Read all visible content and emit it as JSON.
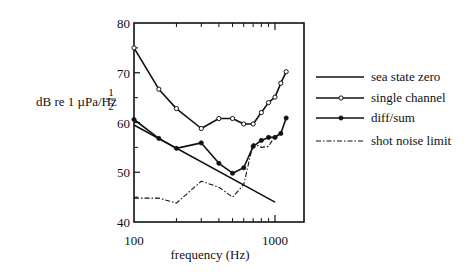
{
  "chart_data": {
    "type": "line",
    "title": "",
    "xlabel": "frequency (Hz)",
    "ylabel": "dB re 1 µPa/Hz",
    "ylabel_exponent_num": "1",
    "ylabel_exponent_den": "2",
    "xscale": "log",
    "xlim": [
      100,
      1600
    ],
    "ylim": [
      40,
      80
    ],
    "x_tick_labels": [
      {
        "value": 100,
        "label": "100"
      },
      {
        "value": 1000,
        "label": "1000"
      }
    ],
    "x_minor_ticks": [
      200,
      300,
      400,
      500,
      600,
      700,
      800,
      900
    ],
    "y_tick_labels": [
      {
        "value": 40,
        "label": "40"
      },
      {
        "value": 50,
        "label": "50"
      },
      {
        "value": 60,
        "label": "60"
      },
      {
        "value": 70,
        "label": "70"
      },
      {
        "value": 80,
        "label": "80"
      }
    ],
    "y_minor_ticks": [
      45,
      55,
      65,
      75
    ],
    "grid": false,
    "legend_position": "right",
    "series": [
      {
        "name": "sea state zero",
        "style": "solid",
        "marker": "none",
        "x": [
          100,
          1000
        ],
        "y": [
          59.5,
          44.0
        ]
      },
      {
        "name": "single channel",
        "style": "solid",
        "marker": "open-circle",
        "x": [
          100,
          150,
          200,
          300,
          400,
          500,
          600,
          700,
          800,
          900,
          1000,
          1100,
          1200
        ],
        "y": [
          75.0,
          66.7,
          62.8,
          58.8,
          60.8,
          60.8,
          59.7,
          59.7,
          62.0,
          64.0,
          65.1,
          67.9,
          70.2
        ]
      },
      {
        "name": "diff/sum",
        "style": "solid",
        "marker": "filled-circle",
        "x": [
          100,
          150,
          200,
          300,
          400,
          500,
          600,
          700,
          800,
          900,
          1000,
          1100,
          1200
        ],
        "y": [
          60.6,
          56.8,
          54.8,
          55.9,
          51.8,
          49.8,
          50.9,
          55.2,
          56.4,
          57.0,
          57.0,
          57.8,
          60.9
        ]
      },
      {
        "name": "shot noise limit",
        "style": "dash-dot",
        "marker": "none",
        "x": [
          100,
          150,
          200,
          300,
          400,
          500,
          600,
          700,
          800,
          900,
          1000,
          1100
        ],
        "y": [
          44.8,
          44.8,
          43.8,
          48.2,
          47.0,
          45.0,
          47.5,
          55.8,
          55.0,
          55.2,
          57.2,
          57.8
        ]
      }
    ]
  }
}
